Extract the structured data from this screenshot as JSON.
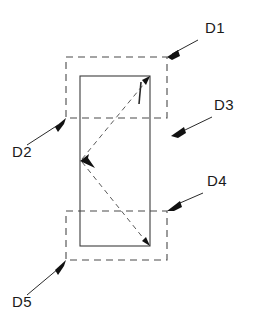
{
  "diagram": {
    "background_color": "#ffffff",
    "line_color": "#3c3c3c",
    "dashed_color": "#4a4a4a",
    "label_color": "#1a1a1a",
    "callouts": [
      {
        "id": "D1",
        "label": "D1",
        "label_x": 205,
        "label_y": 33,
        "leader_from_x": 198,
        "leader_from_y": 40,
        "leader_to_x": 168,
        "leader_to_y": 57
      },
      {
        "id": "D2",
        "label": "D2",
        "label_x": 12,
        "label_y": 157,
        "leader_from_x": 27,
        "leader_from_y": 145,
        "leader_to_x": 65,
        "leader_to_y": 118
      },
      {
        "id": "D3",
        "label": "D3",
        "label_x": 214,
        "label_y": 110,
        "leader_from_x": 212,
        "leader_from_y": 117,
        "leader_to_x": 171,
        "leader_to_y": 136
      },
      {
        "id": "D4",
        "label": "D4",
        "label_x": 207,
        "label_y": 186,
        "leader_from_x": 203,
        "leader_from_y": 193,
        "leader_to_x": 168,
        "leader_to_y": 211
      },
      {
        "id": "D5",
        "label": "D5",
        "label_x": 12,
        "label_y": 307,
        "leader_from_x": 27,
        "leader_from_y": 295,
        "leader_to_x": 65,
        "leader_to_y": 261
      }
    ],
    "shapes": {
      "solid_rect": {
        "x": 80,
        "y": 76,
        "width": 70,
        "height": 170
      },
      "dashed_rect_top": {
        "x": 66,
        "y": 57,
        "width": 101,
        "height": 61
      },
      "dashed_rect_bottom": {
        "x": 66,
        "y": 211,
        "width": 101,
        "height": 49
      }
    },
    "internal_leaders": [
      {
        "from_x": 80,
        "from_y": 160,
        "to_x": 150,
        "to_y": 77
      },
      {
        "from_x": 80,
        "from_y": 160,
        "to_x": 150,
        "to_y": 246
      }
    ],
    "tick_mark": {
      "x1": 141,
      "y1": 82,
      "x2": 139,
      "y2": 104
    }
  }
}
